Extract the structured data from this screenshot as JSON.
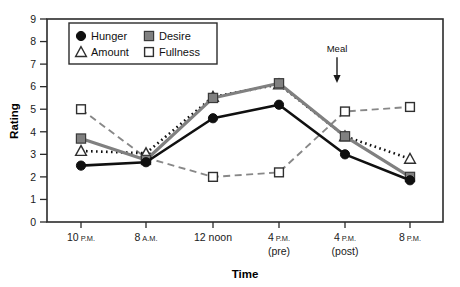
{
  "chart_data": {
    "type": "line",
    "title": "",
    "xlabel": "Time",
    "ylabel": "Rating",
    "categories": [
      "10 P.M.",
      "8 A.M.",
      "12 noon",
      "4 P.M. (pre)",
      "4 P.M. (post)",
      "8 P.M."
    ],
    "x_tick_main": [
      "10",
      "8",
      "12 noon",
      "4",
      "4",
      "8"
    ],
    "x_tick_suffix": [
      "P.M.",
      "A.M.",
      "",
      "P.M.",
      "P.M.",
      "P.M."
    ],
    "x_tick_second_line": [
      "",
      "",
      "",
      "(pre)",
      "(post)",
      ""
    ],
    "ylim": [
      0,
      9
    ],
    "y_ticks": [
      0,
      1,
      2,
      3,
      4,
      5,
      6,
      7,
      8,
      9
    ],
    "grid": false,
    "legend_position": "top-left-inside",
    "series": [
      {
        "name": "Hunger",
        "marker": "filled-circle",
        "color": "#101010",
        "line_style": "solid",
        "values": [
          2.5,
          2.65,
          4.6,
          5.2,
          3.0,
          1.85
        ]
      },
      {
        "name": "Desire",
        "marker": "filled-square",
        "color": "#808080",
        "line_style": "solid",
        "values": [
          3.7,
          2.75,
          5.5,
          6.15,
          3.8,
          2.0
        ]
      },
      {
        "name": "Amount",
        "marker": "open-triangle",
        "color": "#101010",
        "line_style": "dotted",
        "values": [
          3.15,
          3.05,
          5.55,
          6.1,
          3.8,
          2.8
        ]
      },
      {
        "name": "Fullness",
        "marker": "open-square",
        "color": "#888888",
        "line_style": "dashed",
        "values": [
          5.0,
          2.85,
          2.0,
          2.2,
          4.9,
          5.1
        ]
      }
    ],
    "annotations": [
      {
        "label": "Meal",
        "type": "down-arrow",
        "x_category_index": 4,
        "y_top": 7.3,
        "y_bottom": 6.3
      }
    ]
  },
  "legend": {
    "entries": [
      {
        "label": "Hunger",
        "marker": "filled-circle"
      },
      {
        "label": "Desire",
        "marker": "filled-square"
      },
      {
        "label": "Amount",
        "marker": "open-triangle"
      },
      {
        "label": "Fullness",
        "marker": "open-square"
      }
    ]
  },
  "colors": {
    "axis": "#2b2b2b",
    "black_series": "#101010",
    "gray_series": "#808080",
    "fullness_gray": "#888888",
    "background": "#ffffff"
  }
}
